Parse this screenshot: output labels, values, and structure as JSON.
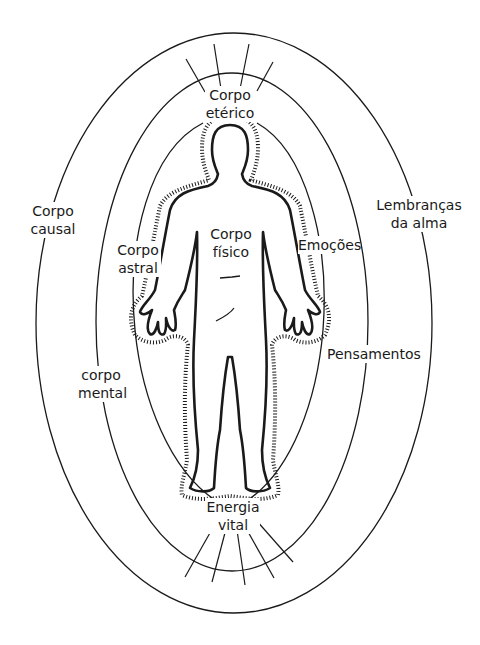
{
  "diagram": {
    "type": "human energy body / aura layers",
    "colors": {
      "line": "#1a1a1a",
      "background": "#ffffff"
    },
    "layers": [
      {
        "id": "outer",
        "name": "Corpo causal"
      },
      {
        "id": "middle",
        "name": "corpo mental"
      },
      {
        "id": "inner",
        "name": "Corpo astral"
      },
      {
        "id": "aura-dotted",
        "name": "Corpo etérico"
      },
      {
        "id": "body",
        "name": "Corpo físico"
      }
    ],
    "labels": {
      "etheric": {
        "line1": "Corpo",
        "line2": "etérico"
      },
      "causal": {
        "line1": "Corpo",
        "line2": "causal"
      },
      "soul_memories": {
        "line1": "Lembranças",
        "line2": "da alma"
      },
      "astral": {
        "line1": "Corpo",
        "line2": "astral"
      },
      "physical": {
        "line1": "Corpo",
        "line2": "físico"
      },
      "emotions": {
        "line1": "Emoções"
      },
      "thoughts": {
        "line1": "Pensamentos"
      },
      "mental": {
        "line1": "corpo",
        "line2": "mental"
      },
      "vital_energy": {
        "line1": "Energia",
        "line2": "vital"
      }
    }
  }
}
